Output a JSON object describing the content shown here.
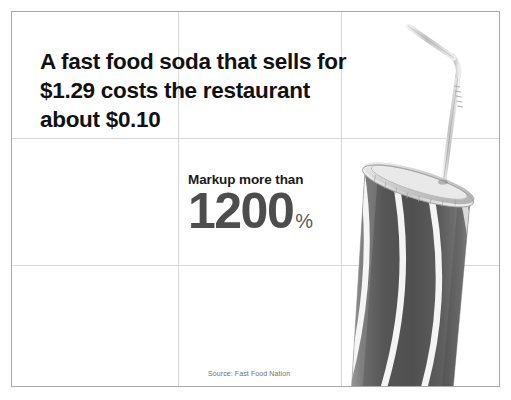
{
  "slide": {
    "headline_lines": [
      "A fast food soda that sells for",
      "$1.29 costs the restaurant",
      "about $0.10"
    ],
    "stat": {
      "label": "Markup more than",
      "number": "1200",
      "unit": "%"
    },
    "source": "Source: Fast Food Nation",
    "photo": {
      "name": "soda-cup-photo",
      "description": "Tilted fast food soda cup with lid and bent straw"
    }
  },
  "colors": {
    "headline_text": "#111111",
    "stat_label_text": "#1a1a1a",
    "stat_number_text": "#4d4d4d",
    "stat_unit_text": "#5a5a5a",
    "source_text": "#6f6f6f",
    "grid_line": "#d8d8d8",
    "slide_border": "#a8a8a8",
    "background": "#ffffff",
    "cup_body_dark": "#5f5f5f",
    "cup_stripe_light": "#f2f2f2",
    "cup_lid": "#dcdcdc",
    "straw": "#cfcfcf"
  }
}
